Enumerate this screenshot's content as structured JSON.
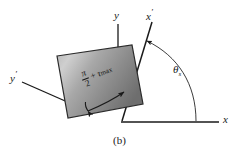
{
  "figure": {
    "caption": "(b)",
    "type": "stress-element-rotated-axes-diagram",
    "axes": {
      "x": {
        "label": "x",
        "prime": false
      },
      "y": {
        "label": "y",
        "prime": false
      },
      "x_prime": {
        "label": "x",
        "prime": true,
        "prime_mark": "′"
      },
      "y_prime": {
        "label": "y",
        "prime": true,
        "prime_mark": "′"
      }
    },
    "angle": {
      "symbol": "θ",
      "subscript": "s",
      "description": "rotation angle from x-axis to x-prime axis"
    },
    "element": {
      "numerator": "π",
      "denominator": "2",
      "operator": "+",
      "stress_symbol": "τ",
      "stress_subscript": "max",
      "fill_description": "gray gradient square rotated counter-clockwise"
    },
    "colors": {
      "line": "#1a1a1a",
      "text": "#1a1a1a",
      "background": "#ffffff",
      "element_fill_light": "#c9c9c9",
      "element_fill_mid": "#9a9a9a",
      "element_fill_dark": "#6f6f6f",
      "element_stroke": "#2a2a2a"
    }
  }
}
